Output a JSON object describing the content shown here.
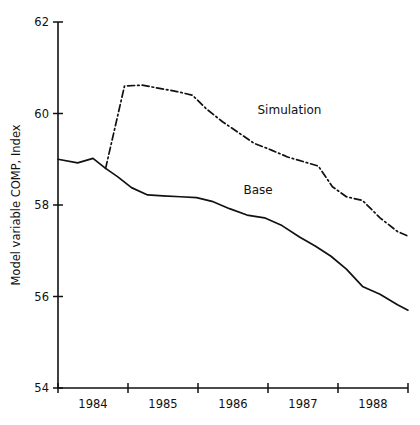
{
  "chart_data": {
    "type": "line",
    "title": "",
    "xlabel": "",
    "ylabel": "Model variable COMP, Index",
    "ylim": [
      54,
      62
    ],
    "yticks": [
      54,
      56,
      58,
      60,
      62
    ],
    "ytick_labels": [
      "54",
      "56",
      "58",
      "60",
      "62"
    ],
    "xlim": [
      1983.5,
      1988.5
    ],
    "xticks": [
      1983.5,
      1984.5,
      1985.5,
      1986.5,
      1987.5,
      1988.5
    ],
    "xtick_labels": [
      "1984",
      "1985",
      "1986",
      "1987",
      "1988"
    ],
    "grid": false,
    "legend_position": "inline-annotations",
    "series": [
      {
        "name": "Base",
        "style": "solid",
        "label": "Base",
        "label_x": 1986.15,
        "label_y": 58.25,
        "x": [
          1983.5,
          1983.78,
          1984.0,
          1984.18,
          1984.35,
          1984.55,
          1984.78,
          1985.0,
          1985.25,
          1985.48,
          1985.7,
          1985.95,
          1986.2,
          1986.45,
          1986.7,
          1986.95,
          1987.18,
          1987.4,
          1987.62,
          1987.85,
          1988.1,
          1988.35,
          1988.5
        ],
        "y": [
          59.0,
          58.92,
          59.02,
          58.8,
          58.62,
          58.38,
          58.22,
          58.2,
          58.18,
          58.16,
          58.08,
          57.92,
          57.78,
          57.72,
          57.55,
          57.3,
          57.1,
          56.88,
          56.6,
          56.22,
          56.05,
          55.82,
          55.7
        ]
      },
      {
        "name": "Simulation",
        "style": "dash-dot",
        "label": "Simulation",
        "label_x": 1986.35,
        "label_y": 60.0,
        "x": [
          1984.18,
          1984.45,
          1984.7,
          1984.95,
          1985.2,
          1985.42,
          1985.62,
          1985.85,
          1986.08,
          1986.3,
          1986.55,
          1986.78,
          1987.0,
          1987.22,
          1987.42,
          1987.62,
          1987.85,
          1988.1,
          1988.35,
          1988.5
        ],
        "y": [
          58.8,
          60.6,
          60.62,
          60.55,
          60.48,
          60.4,
          60.1,
          59.82,
          59.58,
          59.35,
          59.2,
          59.05,
          58.95,
          58.85,
          58.4,
          58.18,
          58.1,
          57.72,
          57.42,
          57.32
        ]
      }
    ]
  }
}
